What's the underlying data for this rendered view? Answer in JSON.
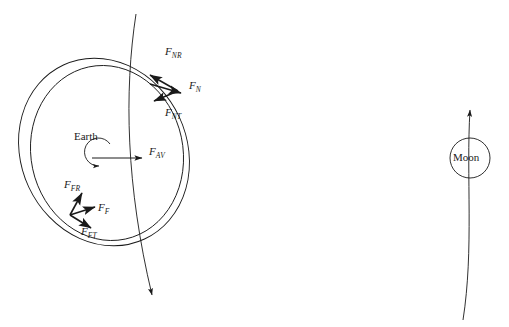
{
  "figure": {
    "background_color": "#ffffff",
    "stroke_color": "#1a1a1a",
    "width": 509,
    "height": 327
  },
  "bodies": [
    {
      "id": "earth",
      "label": "Earth",
      "label_x": 74,
      "label_y": 136,
      "center_x": 104,
      "center_y": 152,
      "shape": "two-overlapping-tilted-ellipses"
    },
    {
      "id": "moon",
      "label": "Moon",
      "label_x": 456,
      "label_y": 153,
      "center_x": 470,
      "center_y": 158,
      "radius": 20,
      "shape": "circle"
    }
  ],
  "vectors": [
    {
      "id": "f-nr",
      "label": "F",
      "subscript": "NR",
      "label_x": 166,
      "label_y": 50,
      "direction": "up-left",
      "origin_x": 178,
      "origin_y": 91,
      "tip_x": 152,
      "tip_y": 76
    },
    {
      "id": "f-n",
      "label": "F",
      "subscript": "N",
      "label_x": 190,
      "label_y": 84,
      "direction": "right-down",
      "origin_x": 152,
      "origin_y": 84,
      "tip_x": 182,
      "tip_y": 93
    },
    {
      "id": "f-nt",
      "label": "F",
      "subscript": "NT",
      "label_x": 166,
      "label_y": 110,
      "direction": "down-left",
      "origin_x": 178,
      "origin_y": 91,
      "tip_x": 155,
      "tip_y": 100
    },
    {
      "id": "f-av",
      "label": "F",
      "subscript": "AV",
      "label_x": 150,
      "label_y": 150,
      "direction": "right",
      "origin_x": 110,
      "origin_y": 158,
      "tip_x": 142,
      "tip_y": 158
    },
    {
      "id": "f-fr",
      "label": "F",
      "subscript": "FR",
      "label_x": 65,
      "label_y": 182,
      "direction": "up-right",
      "origin_x": 70,
      "origin_y": 215,
      "tip_x": 82,
      "tip_y": 194
    },
    {
      "id": "f-f",
      "label": "F",
      "subscript": "F",
      "label_x": 99,
      "label_y": 205,
      "direction": "right",
      "origin_x": 70,
      "origin_y": 215,
      "tip_x": 96,
      "tip_y": 208
    },
    {
      "id": "f-ft",
      "label": "F",
      "subscript": "FT",
      "label_x": 82,
      "label_y": 230,
      "direction": "down-right",
      "origin_x": 70,
      "origin_y": 215,
      "tip_x": 92,
      "tip_y": 228
    }
  ],
  "rotation_arrow": {
    "id": "earth-spin",
    "direction": "counterclockwise",
    "center_x": 110,
    "center_y": 158,
    "radius": 14
  },
  "orbit_lines": [
    {
      "id": "earth-orbit-path",
      "description": "curved trajectory through Earth with downward arrowhead",
      "start_x": 136,
      "start_y": 14,
      "end_x": 152,
      "end_y": 301,
      "arrow_at": "end-down"
    },
    {
      "id": "moon-orbit-path",
      "description": "curved trajectory through Moon with upward arrowhead",
      "start_x": 463,
      "start_y": 318,
      "end_x": 470,
      "end_y": 103,
      "arrow_at": "end-up"
    }
  ]
}
